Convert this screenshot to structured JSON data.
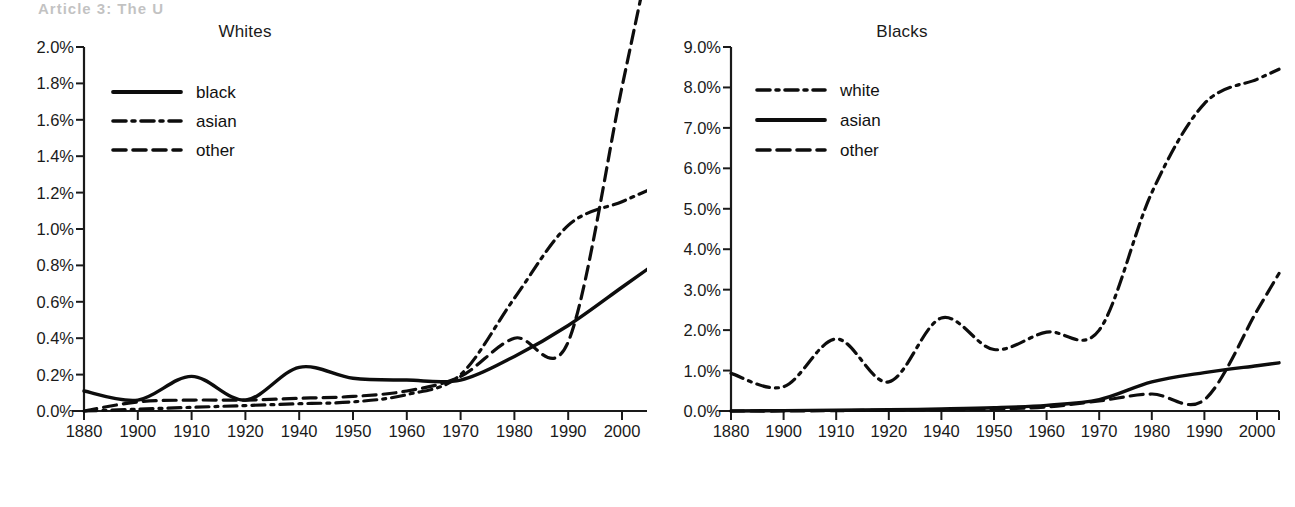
{
  "page": {
    "artifact_text": "Article 3:  The U",
    "background": "#ffffff",
    "ink_color": "#0d0d0d"
  },
  "chart_data": [
    {
      "id": "whites",
      "type": "line",
      "title": "Whites",
      "xlabel": "",
      "ylabel": "",
      "x": [
        1880,
        1900,
        1910,
        1920,
        1940,
        1950,
        1960,
        1970,
        1980,
        1990,
        2000
      ],
      "xtick_labels": [
        "1880",
        "1900",
        "1910",
        "1920",
        "1940",
        "1950",
        "1960",
        "1970",
        "1980",
        "1990",
        "2000"
      ],
      "ytick_labels": [
        "0.0%",
        "0.2%",
        "0.4%",
        "0.6%",
        "0.8%",
        "1.0%",
        "1.2%",
        "1.4%",
        "1.6%",
        "1.8%",
        "2.0%"
      ],
      "ylim": [
        0.0,
        2.0
      ],
      "ytick_values": [
        0.0,
        0.2,
        0.4,
        0.6,
        0.8,
        1.0,
        1.2,
        1.4,
        1.6,
        1.8,
        2.0
      ],
      "grid": false,
      "legend_position": "upper-left",
      "series": [
        {
          "name": "black",
          "style": "solid",
          "values": [
            0.11,
            0.06,
            0.19,
            0.06,
            0.24,
            0.18,
            0.17,
            0.17,
            0.3,
            0.47,
            0.68
          ],
          "end_value": 0.68
        },
        {
          "name": "asian",
          "style": "dash-dot",
          "values": [
            0.0,
            0.01,
            0.02,
            0.03,
            0.04,
            0.05,
            0.09,
            0.2,
            0.62,
            1.02,
            1.15
          ],
          "end_value": 1.15
        },
        {
          "name": "other",
          "style": "dashed",
          "values": [
            0.0,
            0.05,
            0.06,
            0.06,
            0.07,
            0.08,
            0.11,
            0.19,
            0.4,
            0.38,
            1.78
          ],
          "end_value": 1.78
        }
      ]
    },
    {
      "id": "blacks",
      "type": "line",
      "title": "Blacks",
      "xlabel": "",
      "ylabel": "",
      "x": [
        1880,
        1900,
        1910,
        1920,
        1940,
        1950,
        1960,
        1970,
        1980,
        1990,
        2000
      ],
      "xtick_labels": [
        "1880",
        "1900",
        "1910",
        "1920",
        "1940",
        "1950",
        "1960",
        "1970",
        "1980",
        "1990",
        "2000"
      ],
      "ytick_labels": [
        "0.0%",
        "1.0%",
        "2.0%",
        "3.0%",
        "4.0%",
        "5.0%",
        "6.0%",
        "7.0%",
        "8.0%",
        "9.0%"
      ],
      "ylim": [
        0.0,
        9.0
      ],
      "ytick_values": [
        0.0,
        1.0,
        2.0,
        3.0,
        4.0,
        5.0,
        6.0,
        7.0,
        8.0,
        9.0
      ],
      "grid": false,
      "legend_position": "upper-left",
      "series": [
        {
          "name": "white",
          "style": "dash-dot",
          "values": [
            0.93,
            0.6,
            1.78,
            0.72,
            2.3,
            1.52,
            1.95,
            2.0,
            5.4,
            7.6,
            8.2
          ],
          "end_value": 8.2
        },
        {
          "name": "asian",
          "style": "solid",
          "values": [
            0.0,
            0.01,
            0.02,
            0.03,
            0.05,
            0.08,
            0.14,
            0.28,
            0.72,
            0.95,
            1.12
          ],
          "end_value": 1.12
        },
        {
          "name": "other",
          "style": "dashed",
          "values": [
            0.0,
            0.0,
            0.01,
            0.02,
            0.03,
            0.05,
            0.1,
            0.25,
            0.42,
            0.28,
            2.48
          ],
          "end_value": 2.48
        }
      ]
    }
  ]
}
